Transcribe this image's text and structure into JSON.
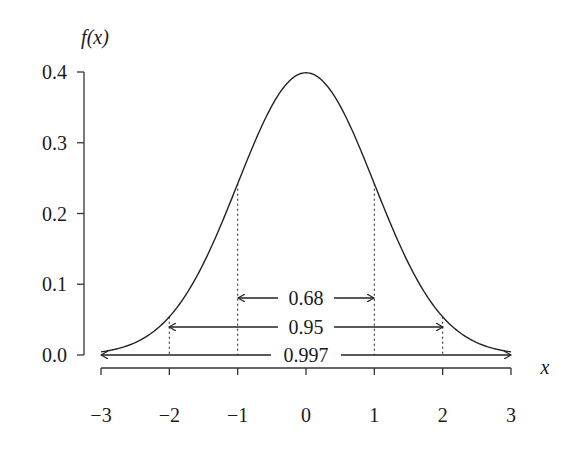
{
  "chart_data": {
    "type": "line",
    "title": "",
    "ylabel": "f(x)",
    "xlabel": "x",
    "xlim": [
      -3,
      3
    ],
    "ylim": [
      0,
      0.4
    ],
    "grid": false,
    "legend": null,
    "x_ticks": [
      "−3",
      "−2",
      "−1",
      "0",
      "1",
      "2",
      "3"
    ],
    "y_ticks": [
      "0.0",
      "0.1",
      "0.2",
      "0.3",
      "0.4"
    ],
    "series": [
      {
        "name": "Standard normal density",
        "x": [
          -3,
          -2.5,
          -2,
          -1.5,
          -1,
          -0.5,
          0,
          0.5,
          1,
          1.5,
          2,
          2.5,
          3
        ],
        "y": [
          0.0044,
          0.0175,
          0.054,
          0.1295,
          0.242,
          0.3521,
          0.3989,
          0.3521,
          0.242,
          0.1295,
          0.054,
          0.0175,
          0.0044
        ]
      }
    ],
    "annotations": [
      {
        "label": "0.68",
        "from": -1,
        "to": 1,
        "type": "double-arrow"
      },
      {
        "label": "0.95",
        "from": -2,
        "to": 2,
        "type": "double-arrow"
      },
      {
        "label": "0.997",
        "from": -3,
        "to": 3,
        "type": "double-arrow"
      }
    ],
    "dotted_verticals": [
      -2,
      -1,
      1,
      2
    ]
  },
  "labels": {
    "y_axis_title": "f(x)",
    "x_axis_title": "x",
    "span_68": "0.68",
    "span_95": "0.95",
    "span_997": "0.997"
  }
}
